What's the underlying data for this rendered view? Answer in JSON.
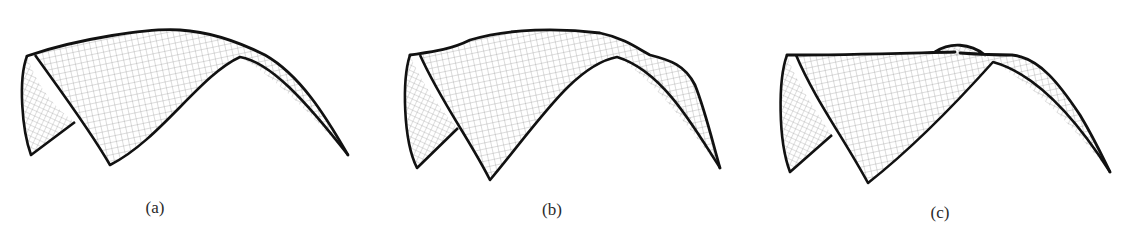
{
  "figure": {
    "panels": [
      {
        "id": "a",
        "label": "(a)",
        "label_pos": [
          155,
          198
        ],
        "description": "shell surface mesh with single smooth ridge"
      },
      {
        "id": "b",
        "label": "(b)",
        "label_pos": [
          552,
          200
        ],
        "description": "shell surface mesh with undulating ridge"
      },
      {
        "id": "c",
        "label": "(c)",
        "label_pos": [
          940,
          203
        ],
        "description": "shell surface mesh with twisted ridge and bump"
      }
    ],
    "colors": {
      "outline": "#111111",
      "mesh": "#8a8a8a",
      "background": "#ffffff"
    }
  }
}
